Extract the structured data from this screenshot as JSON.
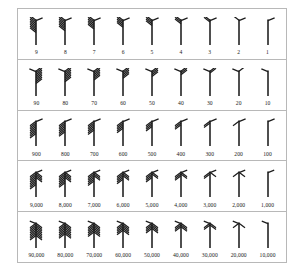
{
  "chart_data": {
    "type": "table",
    "title": "",
    "rows": [
      {
        "place": "units",
        "labels": [
          "9",
          "8",
          "7",
          "6",
          "5",
          "4",
          "3",
          "2",
          "1"
        ],
        "values": [
          9,
          8,
          7,
          6,
          5,
          4,
          3,
          2,
          1
        ],
        "style": "barbs-upper-left-plus-upper-right-stroke"
      },
      {
        "place": "tens",
        "labels": [
          "90",
          "80",
          "70",
          "60",
          "50",
          "40",
          "30",
          "20",
          "10"
        ],
        "values": [
          90,
          80,
          70,
          60,
          50,
          40,
          30,
          20,
          10
        ],
        "style": "barbs-mirrored-upper-right"
      },
      {
        "place": "hundreds",
        "labels": [
          "900",
          "800",
          "700",
          "600",
          "500",
          "400",
          "300",
          "200",
          "100"
        ],
        "values": [
          900,
          800,
          700,
          600,
          500,
          400,
          300,
          200,
          100
        ],
        "style": "barbs-downward-left"
      },
      {
        "place": "thousands",
        "labels": [
          "9,000",
          "8,000",
          "7,000",
          "6,000",
          "5,000",
          "4,000",
          "3,000",
          "2,000",
          "1,000"
        ],
        "values": [
          9000,
          8000,
          7000,
          6000,
          5000,
          4000,
          3000,
          2000,
          1000
        ],
        "style": "barbs-both-sides-downward"
      },
      {
        "place": "ten-thousands",
        "labels": [
          "90,000",
          "80,000",
          "70,000",
          "60,000",
          "50,000",
          "40,000",
          "30,000",
          "20,000",
          "10,000"
        ],
        "values": [
          90000,
          80000,
          70000,
          60000,
          50000,
          40000,
          30000,
          20000,
          10000
        ],
        "style": "barbs-both-sides-dense"
      }
    ],
    "ink_color": "#1a1a1a",
    "border_color": "#b8b8b8",
    "background_color": "#ffffff"
  }
}
